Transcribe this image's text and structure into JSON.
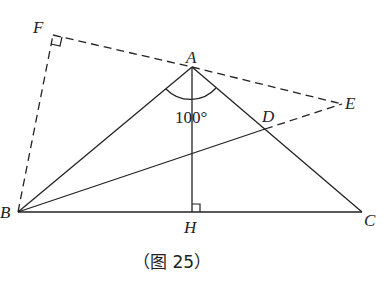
{
  "diagram": {
    "points": {
      "A": {
        "label": "A",
        "x": 192,
        "y": 67
      },
      "B": {
        "label": "B",
        "x": 18,
        "y": 212
      },
      "C": {
        "label": "C",
        "x": 362,
        "y": 212
      },
      "H": {
        "label": "H",
        "x": 192,
        "y": 212
      },
      "D": {
        "label": "D",
        "x": 265,
        "y": 129
      },
      "E": {
        "label": "E",
        "x": 342,
        "y": 104
      },
      "F": {
        "label": "F",
        "x": 53,
        "y": 35
      }
    },
    "angle_label": "100°",
    "caption": "（图 25）",
    "solid_segments": [
      "AB",
      "AC",
      "BC",
      "AH",
      "BD"
    ],
    "dashed_segments": [
      "FA",
      "AE",
      "DE",
      "BF"
    ],
    "right_angles": [
      "F",
      "H"
    ]
  }
}
